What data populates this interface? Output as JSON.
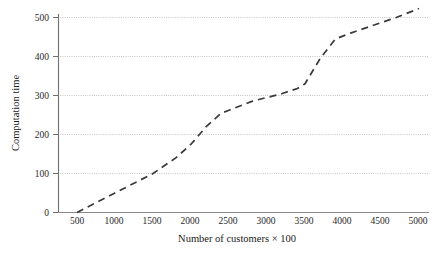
{
  "chart_data": {
    "type": "line",
    "title": "",
    "xlabel": "Number of customers × 100",
    "ylabel": "Computation time",
    "xlim": [
      250,
      5200
    ],
    "ylim": [
      0,
      545
    ],
    "grid": true,
    "legend": null,
    "xticks": [
      500,
      1000,
      1500,
      2000,
      2500,
      3000,
      3500,
      4000,
      4500,
      5000
    ],
    "xtick_labels": [
      "500",
      "1000",
      "1500",
      "2000",
      "2500",
      "3000",
      "3500",
      "4000",
      "4500",
      "5000"
    ],
    "yticks": [
      0,
      100,
      200,
      300,
      400,
      500
    ],
    "ytick_labels": [
      "0",
      "100",
      "200",
      "300",
      "400",
      "500"
    ],
    "line_style": "dashed",
    "line_color": "#3a3a3a",
    "grid_color": "#b9b9b9",
    "axis_color": "#6f6f6f",
    "series": [
      {
        "name": "computation time",
        "x": [
          500,
          1000,
          1500,
          1800,
          2000,
          2200,
          2400,
          2500,
          2800,
          3000,
          3200,
          3400,
          3500,
          3700,
          3900,
          4100,
          4400,
          4700,
          5000
        ],
        "values": [
          0,
          50,
          100,
          140,
          175,
          220,
          255,
          262,
          285,
          295,
          305,
          318,
          330,
          395,
          445,
          460,
          480,
          500,
          523
        ]
      }
    ]
  },
  "axes": {
    "y_axis_title": "Computation time",
    "x_axis_title": "Number of customers × 100"
  }
}
